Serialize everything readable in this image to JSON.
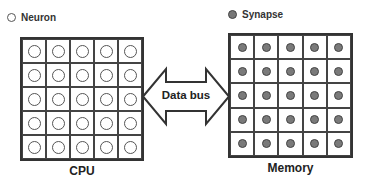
{
  "legend": {
    "neuron": {
      "label": "Neuron",
      "icon": "hollow-circle"
    },
    "synapse": {
      "label": "Synapse",
      "icon": "filled-gray-circle"
    }
  },
  "cpu": {
    "label": "CPU",
    "rows": 5,
    "cols": 5,
    "cell_symbol": "neuron"
  },
  "memory": {
    "label": "Memory",
    "rows": 5,
    "cols": 5,
    "cell_symbol": "synapse"
  },
  "bus": {
    "label": "Data bus",
    "direction": "bidirectional"
  },
  "colors": {
    "line": "#333333",
    "synapse_fill": "#7a7a7a",
    "background": "#ffffff"
  }
}
